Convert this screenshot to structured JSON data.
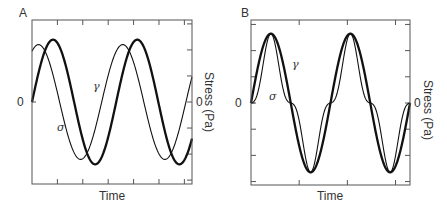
{
  "chart_data": [
    {
      "panel": "A",
      "type": "line",
      "title": "",
      "xlabel": "Time",
      "ylabel_left": "",
      "ylabel_right": "Stress (Pa)",
      "left_tick_label": "0",
      "right_tick_label": "0",
      "frame": {
        "x0": 32,
        "y0": 20,
        "x1": 192,
        "y1": 184
      },
      "zero_y": 102,
      "x_ticks": 6,
      "right_y_ticks": 6,
      "x_range_periods": [
        0,
        1.9
      ],
      "series": [
        {
          "name": "γ",
          "label": "γ",
          "description": "strain, sinusoidal, thick line",
          "amplitude": 0.76,
          "phase_deg": 0,
          "harmonic3": 0,
          "stroke_width": 2.3
        },
        {
          "name": "σ",
          "label": "σ",
          "description": "stress, sinusoidal, leads strain (~60°), thin line",
          "amplitude": 0.7,
          "phase_deg": 62,
          "harmonic3": 0,
          "stroke_width": 1.1
        }
      ],
      "annotations": [
        {
          "text": "γ",
          "x": 93,
          "y": 90
        },
        {
          "text": "σ",
          "x": 58,
          "y": 131
        }
      ]
    },
    {
      "panel": "B",
      "type": "line",
      "title": "",
      "xlabel": "Time",
      "ylabel_left": "",
      "ylabel_right": "Stress (Pa)",
      "left_tick_label": "0",
      "right_tick_label": "0",
      "frame": {
        "x0": 251,
        "y0": 20,
        "x1": 410,
        "y1": 185
      },
      "zero_y": 103,
      "x_ticks": 3,
      "right_y_ticks": 6,
      "left_y_ticks": 6,
      "x_range_periods": [
        0,
        2.0
      ],
      "series": [
        {
          "name": "γ",
          "label": "γ",
          "description": "strain, sinusoidal, thick line",
          "amplitude": 0.84,
          "phase_deg": 0,
          "harmonic3": 0,
          "stroke_width": 2.3
        },
        {
          "name": "σ",
          "label": "σ",
          "description": "stress, in phase with strain, distorted by 3rd harmonic (nonlinear)",
          "amplitude": 0.64,
          "phase_deg": 0,
          "harmonic3": -0.2,
          "stroke_width": 1.1
        }
      ],
      "annotations": [
        {
          "text": "γ",
          "x": 292,
          "y": 68
        },
        {
          "text": "σ",
          "x": 270,
          "y": 100
        }
      ]
    }
  ],
  "panels": {
    "a": {
      "letter": "A",
      "xlabel": "Time",
      "ylabel_right": "Stress (Pa)",
      "zero_left": "0",
      "zero_right": "0",
      "gamma": "γ",
      "sigma": "σ"
    },
    "b": {
      "letter": "B",
      "xlabel": "Time",
      "ylabel_right": "Stress (Pa)",
      "zero_left": "0",
      "zero_right": "0",
      "gamma": "γ",
      "sigma": "σ"
    }
  },
  "colors": {
    "line": "#111111",
    "frame": "#555555",
    "text": "#333333"
  }
}
